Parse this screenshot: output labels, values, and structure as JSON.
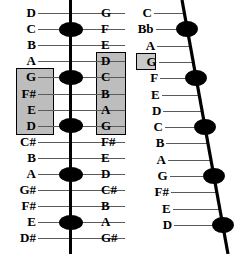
{
  "figure": {
    "background_color": "#ffffff",
    "line_color": "#000000",
    "fretline_color": "#5a5a5a",
    "shade_color": "#bdbdbd",
    "dot_color": "#000000"
  },
  "left_diagram": {
    "name": "straight-neck-diagram",
    "orientation": "vertical",
    "row_count": 15,
    "left_labels": [
      "D",
      "C",
      "B",
      "A",
      "G",
      "F#",
      "E",
      "D",
      "C#",
      "B",
      "A",
      "G#",
      "F#",
      "E",
      "D#"
    ],
    "right_labels": [
      "G",
      "F",
      "E",
      "D",
      "C",
      "B",
      "A",
      "G",
      "F#",
      "E",
      "D",
      "C#",
      "B",
      "A",
      "G#"
    ],
    "left_shaded_rows": [
      4,
      5,
      6,
      7
    ],
    "left_shaded_labels": [
      "G",
      "F#",
      "E",
      "D"
    ],
    "right_shaded_rows": [
      3,
      4,
      5,
      6,
      7
    ],
    "right_shaded_labels": [
      "D",
      "C",
      "B",
      "A",
      "G"
    ],
    "dot_rows": [
      1,
      4,
      7,
      10,
      13
    ],
    "dot_row_labels_left": [
      "C",
      "G",
      "D",
      "A",
      "E"
    ],
    "dot_row_labels_right": [
      "F",
      "C",
      "G",
      "D",
      "A"
    ]
  },
  "right_diagram": {
    "name": "slanted-neck-diagram",
    "orientation": "slanted",
    "row_count": 14,
    "labels": [
      "C",
      "Bb",
      "A",
      "G",
      "F",
      "E",
      "D",
      "C",
      "B",
      "A",
      "G",
      "F#",
      "E",
      "D"
    ],
    "boxed_rows": [
      3
    ],
    "boxed_labels": [
      "G"
    ],
    "dot_rows": [
      1,
      4,
      7,
      10,
      13
    ],
    "dot_row_labels": [
      "Bb",
      "F",
      "C",
      "G",
      "D"
    ]
  }
}
